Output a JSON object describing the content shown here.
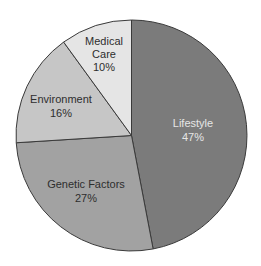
{
  "chart_data": {
    "type": "pie",
    "title": "",
    "categories": [
      "Lifestyle",
      "Genetic Factors",
      "Environment",
      "Medical Care"
    ],
    "values": [
      47,
      27,
      16,
      10
    ],
    "value_labels": [
      "47%",
      "27%",
      "16%",
      "10%"
    ],
    "colors": [
      "#7b7b7b",
      "#a2a2a2",
      "#c6c6c6",
      "#e5e5e5"
    ],
    "label_colors": [
      "#e6e6e6",
      "#2e2e2e",
      "#2e2e2e",
      "#2e2e2e"
    ],
    "start_angle_deg": 0,
    "direction": "clockwise",
    "legend": "none",
    "labels_inside": true
  },
  "slices": [
    {
      "name": "Lifestyle",
      "lines": [
        "Lifestyle"
      ],
      "pct": "47%"
    },
    {
      "name": "Genetic Factors",
      "lines": [
        "Genetic Factors"
      ],
      "pct": "27%"
    },
    {
      "name": "Environment",
      "lines": [
        "Environment"
      ],
      "pct": "16%"
    },
    {
      "name": "Medical Care",
      "lines": [
        "Medical",
        "Care"
      ],
      "pct": "10%"
    }
  ]
}
